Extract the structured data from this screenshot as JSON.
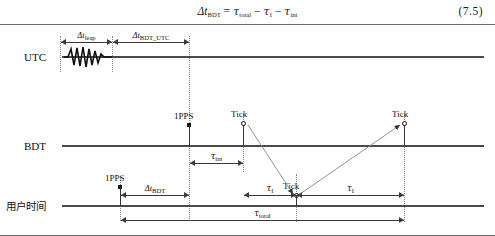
{
  "equation": {
    "text": "Δt_BDT = τ_total − τ_f − τ_int",
    "lhs_delta": "Δ",
    "lhs_var": "t",
    "lhs_sub": "BDT",
    "eq_sign": "=",
    "term1_tau": "τ",
    "term1_sub": "total",
    "minus1": "−",
    "term2_tau": "τ",
    "term2_sub": "f",
    "minus2": "−",
    "term3_tau": "τ",
    "term3_sub": "int",
    "number": "(7.5)"
  },
  "rows": [
    {
      "id": "utc",
      "label": "UTC"
    },
    {
      "id": "bdt",
      "label": "BDT"
    },
    {
      "id": "user",
      "label": "用户时间"
    }
  ],
  "intervals": [
    {
      "id": "leap",
      "delta": "Δ",
      "var": "t",
      "sub": "leap",
      "label": "Δt_leap"
    },
    {
      "id": "bdt_utc",
      "delta": "Δ",
      "var": "t",
      "sub": "BDT_UTC",
      "label": "Δt_BDT_UTC"
    },
    {
      "id": "tau_int",
      "tau": "τ",
      "sub": "int",
      "label": "τ_int"
    },
    {
      "id": "delta_bdt",
      "delta": "Δ",
      "var": "t",
      "sub": "BDT",
      "label": "Δt_BDT"
    },
    {
      "id": "tau_f_left",
      "tau": "τ",
      "sub": "f",
      "label": "τ_f"
    },
    {
      "id": "tau_f_right",
      "tau": "τ",
      "sub": "f",
      "label": "τ_f"
    },
    {
      "id": "tau_total",
      "tau": "τ",
      "sub": "total",
      "label": "τ_total"
    }
  ],
  "markers": [
    {
      "id": "bdt-1pps",
      "type": "square",
      "label": "1PPS"
    },
    {
      "id": "bdt-tick-1",
      "type": "circle",
      "label": "Tick"
    },
    {
      "id": "bdt-tick-2",
      "type": "circle",
      "label": "Tick"
    },
    {
      "id": "user-1pps",
      "type": "square",
      "label": "1PPS"
    },
    {
      "id": "user-tick",
      "type": "circle",
      "label": "Tick"
    }
  ],
  "colors": {
    "line": "#4a4a4a",
    "guide": "#8a8a8a",
    "arrow": "#3a3a3a",
    "text": "#111111",
    "frame": "#6a6a6a"
  }
}
